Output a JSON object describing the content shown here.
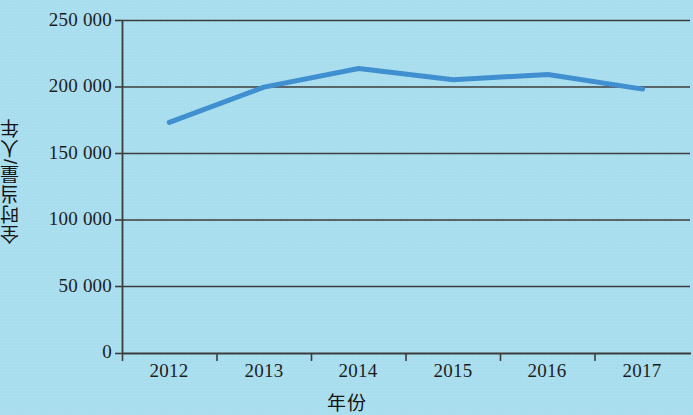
{
  "chart_data": {
    "type": "line",
    "title": "",
    "subtitle": "",
    "xlabel": "年份",
    "ylabel": "全时当量/人年",
    "categories": [
      "2012",
      "2013",
      "2014",
      "2015",
      "2016",
      "2017"
    ],
    "series": [
      {
        "name": "全时当量",
        "values": [
          173500,
          200000,
          214000,
          205500,
          209500,
          198500
        ]
      }
    ],
    "ylim": [
      0,
      250000
    ],
    "y_ticks": [
      0,
      50000,
      100000,
      150000,
      200000,
      250000
    ],
    "y_tick_labels": [
      "0",
      "50 000",
      "100 000",
      "150 000",
      "200 000",
      "250 000"
    ],
    "x_tick_labels": [
      "2012",
      "2013",
      "2014",
      "2015",
      "2016",
      "2017"
    ],
    "grid": true,
    "grid_axis": "y",
    "legend": "none",
    "colors": {
      "background": "#aadff0",
      "line": "#3d8fd1",
      "axis": "#3a3a3a",
      "gridline": "#3a3a3a",
      "text": "#1a1a1a"
    },
    "line_width": 5
  }
}
